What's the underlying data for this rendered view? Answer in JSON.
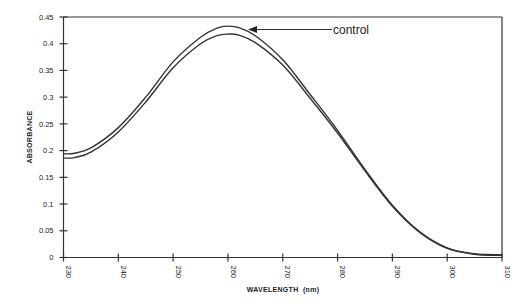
{
  "chart_data": {
    "type": "line",
    "title": "",
    "xlabel": "WAVELENGTH  (nm)",
    "ylabel": "ABSORBANCE",
    "xlim": [
      230,
      310
    ],
    "ylim": [
      0,
      0.45
    ],
    "xticks": [
      230,
      240,
      250,
      260,
      270,
      280,
      290,
      300,
      310
    ],
    "xtick_labels": [
      "230",
      "240",
      "250",
      "260",
      "270",
      "280",
      "290",
      "300",
      "310"
    ],
    "yticks": [
      0,
      0.05,
      0.1,
      0.15,
      0.2,
      0.25,
      0.3,
      0.35,
      0.4,
      0.45
    ],
    "ytick_labels": [
      "0",
      "0.05",
      "0.1",
      "0.15",
      "0.2",
      "0.25",
      "0.3",
      "0.35",
      "0.4",
      "0.45"
    ],
    "grid": false,
    "legend": "none",
    "x": [
      230,
      232,
      235,
      240,
      245,
      250,
      255,
      258,
      260,
      262,
      265,
      270,
      275,
      280,
      285,
      290,
      295,
      300,
      305,
      310
    ],
    "series": [
      {
        "name": "control",
        "color": "#333333",
        "values": [
          0.194,
          0.195,
          0.205,
          0.243,
          0.3,
          0.366,
          0.412,
          0.429,
          0.433,
          0.43,
          0.415,
          0.37,
          0.305,
          0.238,
          0.165,
          0.098,
          0.048,
          0.018,
          0.007,
          0.005
        ]
      },
      {
        "name": "sample",
        "color": "#333333",
        "values": [
          0.186,
          0.187,
          0.197,
          0.235,
          0.291,
          0.355,
          0.4,
          0.415,
          0.418,
          0.416,
          0.402,
          0.36,
          0.298,
          0.233,
          0.162,
          0.096,
          0.047,
          0.017,
          0.006,
          0.004
        ]
      }
    ],
    "annotations": [
      {
        "text": "control",
        "arrow_to": {
          "x": 263,
          "y": 0.425
        },
        "series": "control"
      }
    ]
  }
}
